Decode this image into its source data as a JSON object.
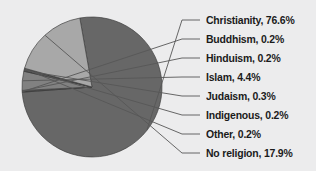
{
  "chart_data": {
    "type": "pie",
    "title": "",
    "subtitle": "",
    "xlabel": "",
    "ylabel": "",
    "legend_position": "right-callout-labels",
    "grid": false,
    "label_format": "{name}, {value}%",
    "categories": [
      "Christianity",
      "Buddhism",
      "Hinduism",
      "Islam",
      "Judaism",
      "Indigenous",
      "Other",
      "No religion"
    ],
    "values": [
      76.6,
      0.2,
      0.2,
      4.4,
      0.3,
      0.2,
      0.2,
      17.9
    ],
    "slices": [
      {
        "name": "Christianity",
        "value": 76.6,
        "label": "Christianity, 76.6%",
        "color": "#676767",
        "label_x": 206,
        "label_y": 14
      },
      {
        "name": "Buddhism",
        "value": 0.2,
        "label": "Buddhism, 0.2%",
        "color": "#3a3a3a",
        "label_x": 206,
        "label_y": 33
      },
      {
        "name": "Hinduism",
        "value": 0.2,
        "label": "Hinduism, 0.2%",
        "color": "#8c8c8c",
        "label_x": 206,
        "label_y": 52
      },
      {
        "name": "Islam",
        "value": 4.4,
        "label": "Islam, 4.4%",
        "color": "#818181",
        "label_x": 206,
        "label_y": 71
      },
      {
        "name": "Judaism",
        "value": 0.3,
        "label": "Judaism, 0.3%",
        "color": "#2e2e2e",
        "label_x": 206,
        "label_y": 90
      },
      {
        "name": "Indigenous",
        "value": 0.2,
        "label": "Indigenous, 0.2%",
        "color": "#6f6f6f",
        "label_x": 206,
        "label_y": 109
      },
      {
        "name": "Other",
        "value": 0.2,
        "label": "Other, 0.2%",
        "color": "#4a4a4a",
        "label_x": 206,
        "label_y": 128
      },
      {
        "name": "No religion",
        "value": 17.9,
        "label": "No religion, 17.9%",
        "color": "#a8a8a8",
        "label_x": 206,
        "label_y": 147
      }
    ],
    "geometry": {
      "center_x": 92,
      "center_y": 87,
      "radius": 70,
      "start_angle_deg": -100.0
    },
    "colors": {
      "background": "#ececed",
      "text": "#1b1b1b",
      "leader_line": "#575757",
      "slice_outline": "#3f3f3f"
    }
  }
}
